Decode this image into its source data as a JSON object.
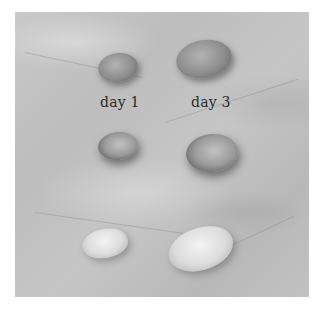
{
  "photo": {
    "subject": "fava beans on marble surface",
    "labels": {
      "day1": "day 1",
      "day3": "day 3"
    },
    "rows": [
      {
        "name": "dry-top",
        "day1": "dry bean",
        "day3": "sprouting bean"
      },
      {
        "name": "soaked-middle",
        "day1": "soaked bean",
        "day3": "sprouting bean"
      },
      {
        "name": "peeled-bottom",
        "day1": "peeled bean",
        "day3": "peeled bean"
      }
    ]
  },
  "colors": {
    "background": "#ffffff",
    "marble": "#c3c3c3",
    "text": "#2a2a2a"
  }
}
